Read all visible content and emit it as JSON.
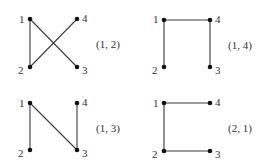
{
  "diagram": {
    "panels": [
      {
        "id": "p12",
        "caption": "(1, 2)",
        "origin": [
          0,
          0
        ],
        "nodes": {
          "1": [
            30,
            19
          ],
          "2": [
            30,
            67
          ],
          "3": [
            77,
            67
          ],
          "4": [
            77,
            19
          ]
        },
        "edges": [
          [
            "1",
            "2"
          ],
          [
            "1",
            "3"
          ],
          [
            "2",
            "4"
          ]
        ]
      },
      {
        "id": "p14",
        "caption": "(1, 4)",
        "origin": [
          0,
          0
        ],
        "nodes": {
          "1": [
            164,
            20
          ],
          "2": [
            164,
            67
          ],
          "3": [
            210,
            67
          ],
          "4": [
            210,
            20
          ]
        },
        "edges": [
          [
            "1",
            "2"
          ],
          [
            "1",
            "4"
          ],
          [
            "4",
            "3"
          ]
        ]
      },
      {
        "id": "p13",
        "caption": "(1, 3)",
        "origin": [
          0,
          0
        ],
        "nodes": {
          "1": [
            30,
            103
          ],
          "2": [
            30,
            150
          ],
          "3": [
            77,
            150
          ],
          "4": [
            77,
            103
          ]
        },
        "edges": [
          [
            "1",
            "2"
          ],
          [
            "1",
            "3"
          ],
          [
            "4",
            "3"
          ]
        ]
      },
      {
        "id": "p21",
        "caption": "(2, 1)",
        "origin": [
          0,
          0
        ],
        "nodes": {
          "1": [
            164,
            103
          ],
          "2": [
            164,
            151
          ],
          "3": [
            210,
            151
          ],
          "4": [
            210,
            103
          ]
        },
        "edges": [
          [
            "1",
            "2"
          ],
          [
            "1",
            "4"
          ],
          [
            "2",
            "3"
          ]
        ]
      }
    ]
  }
}
